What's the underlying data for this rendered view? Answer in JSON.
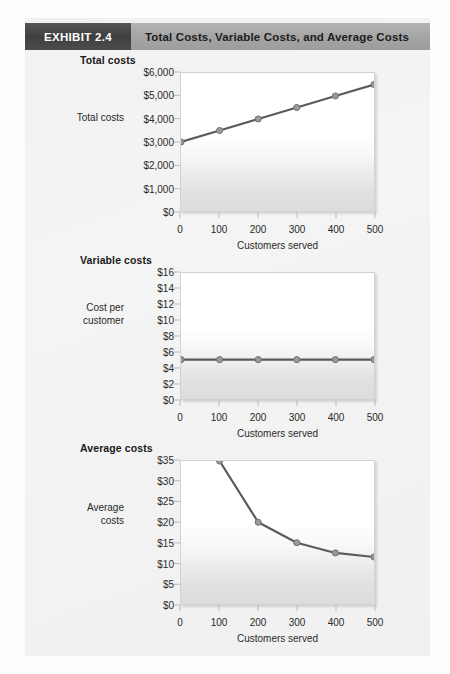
{
  "header": {
    "tag": "EXHIBIT 2.4",
    "title": "Total Costs, Variable Costs, and Average Costs"
  },
  "colors": {
    "tag_bg": "#464647",
    "title_bg": "#a6a6a6",
    "line": "#5a5a5a",
    "marker_fill": "#9a9a9a",
    "marker_stroke": "#6e6e6e",
    "plot_border": "#d2d2d2",
    "panel_bg": "#f4f4f4"
  },
  "chart_data": [
    {
      "id": "total-costs",
      "type": "line",
      "title": "Total costs",
      "ylabel": "Total costs",
      "xlabel": "Customers served",
      "x": [
        0,
        100,
        200,
        300,
        400,
        500
      ],
      "values": [
        3000,
        3500,
        4000,
        4500,
        5000,
        5500
      ],
      "xlim": [
        0,
        500
      ],
      "ylim": [
        0,
        6000
      ],
      "xticks": [
        0,
        100,
        200,
        300,
        400,
        500
      ],
      "xticklabels": [
        "0",
        "100",
        "200",
        "300",
        "400",
        "500"
      ],
      "yticks": [
        0,
        1000,
        2000,
        3000,
        4000,
        5000,
        6000
      ],
      "yticklabels": [
        "$0",
        "$1,000",
        "$2,000",
        "$3,000",
        "$4,000",
        "$5,000",
        "$6,000"
      ],
      "grid": false,
      "legend": "none"
    },
    {
      "id": "variable-costs",
      "type": "line",
      "title": "Variable costs",
      "ylabel": "Cost per customer",
      "xlabel": "Customers served",
      "x": [
        0,
        100,
        200,
        300,
        400,
        500
      ],
      "values": [
        5,
        5,
        5,
        5,
        5,
        5
      ],
      "xlim": [
        0,
        500
      ],
      "ylim": [
        0,
        16
      ],
      "xticks": [
        0,
        100,
        200,
        300,
        400,
        500
      ],
      "xticklabels": [
        "0",
        "100",
        "200",
        "300",
        "400",
        "500"
      ],
      "yticks": [
        0,
        2,
        4,
        6,
        8,
        10,
        12,
        14,
        16
      ],
      "yticklabels": [
        "$0",
        "$2",
        "$4",
        "$6",
        "$8",
        "$10",
        "$12",
        "$14",
        "$16"
      ],
      "grid": false,
      "legend": "none"
    },
    {
      "id": "average-costs",
      "type": "line",
      "title": "Average costs",
      "ylabel": "Average costs",
      "xlabel": "Customers served",
      "x": [
        100,
        200,
        300,
        400,
        500
      ],
      "values": [
        35,
        20,
        15,
        12.5,
        11.5
      ],
      "xlim": [
        0,
        500
      ],
      "ylim": [
        0,
        35
      ],
      "xticks": [
        0,
        100,
        200,
        300,
        400,
        500
      ],
      "xticklabels": [
        "0",
        "100",
        "200",
        "300",
        "400",
        "500"
      ],
      "yticks": [
        0,
        5,
        10,
        15,
        20,
        25,
        30,
        35
      ],
      "yticklabels": [
        "$0",
        "$5",
        "$10",
        "$15",
        "$20",
        "$25",
        "$30",
        "$35"
      ],
      "grid": false,
      "legend": "none"
    }
  ]
}
